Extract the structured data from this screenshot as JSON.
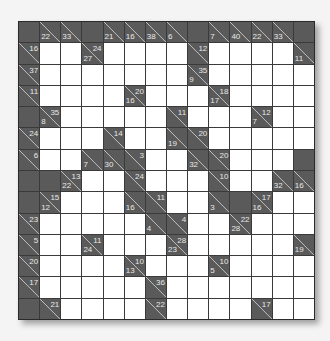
{
  "puzzle": {
    "type": "kakuro",
    "rows": 14,
    "cols": 14,
    "colors": {
      "block": "#5a5a5a",
      "white": "#ffffff",
      "grid_line": "#3a3a3a",
      "clue_text": "#e8e8e8"
    },
    "grid": [
      [
        "X",
        {
          "d": 22
        },
        {
          "d": 33
        },
        "X",
        {
          "d": 21
        },
        {
          "d": 16
        },
        {
          "d": 38
        },
        {
          "d": 6
        },
        "X",
        {
          "d": 7
        },
        {
          "d": 40
        },
        {
          "d": 22
        },
        {
          "d": 33
        },
        "X"
      ],
      [
        {
          "r": 16
        },
        "W",
        "W",
        {
          "d": 27,
          "r": 24
        },
        "W",
        "W",
        "W",
        "W",
        {
          "r": 12
        },
        "W",
        "W",
        "W",
        "W",
        {
          "d": 11
        }
      ],
      [
        {
          "r": 37
        },
        "W",
        "W",
        "W",
        "W",
        "W",
        "W",
        "W",
        {
          "d": 9,
          "r": 35
        },
        "W",
        "W",
        "W",
        "W",
        "W"
      ],
      [
        {
          "r": 11
        },
        "W",
        "W",
        "W",
        "W",
        {
          "d": 16,
          "r": 20
        },
        "W",
        "W",
        "W",
        {
          "d": 17,
          "r": 18
        },
        "W",
        "W",
        "W",
        "W"
      ],
      [
        "X",
        {
          "d": 8,
          "r": 35
        },
        "W",
        "W",
        "W",
        "W",
        "W",
        {
          "r": 11
        },
        "W",
        "W",
        "W",
        {
          "d": 7,
          "r": 12
        },
        "W",
        "W"
      ],
      [
        {
          "r": 24
        },
        "W",
        "W",
        "W",
        {
          "r": 14
        },
        "W",
        "W",
        {
          "d": 19
        },
        {
          "r": 20
        },
        "W",
        "W",
        "W",
        "W",
        "W"
      ],
      [
        {
          "r": 6
        },
        "W",
        "W",
        {
          "d": 7
        },
        {
          "d": 30
        },
        {
          "r": 3
        },
        "W",
        "W",
        {
          "d": 32
        },
        {
          "r": 20
        },
        "W",
        "W",
        "W",
        "X"
      ],
      [
        "X",
        "X",
        {
          "d": 22,
          "r": 13
        },
        "W",
        "W",
        {
          "r": 24
        },
        "W",
        "W",
        "W",
        {
          "r": 10
        },
        "W",
        "W",
        {
          "d": 32
        },
        {
          "d": 16
        }
      ],
      [
        "X",
        {
          "d": 12,
          "r": 15
        },
        "W",
        "W",
        "W",
        {
          "d": 16
        },
        {
          "r": 11
        },
        "W",
        "W",
        {
          "d": 3
        },
        "X",
        {
          "d": 16,
          "r": 17
        },
        "W",
        "W"
      ],
      [
        {
          "r": 23
        },
        "W",
        "W",
        "W",
        "W",
        "W",
        {
          "d": 4
        },
        {
          "r": 4
        },
        "W",
        "W",
        {
          "d": 28,
          "r": 22
        },
        "W",
        "W",
        "W"
      ],
      [
        {
          "r": 5
        },
        "W",
        "W",
        {
          "d": 24,
          "r": 11
        },
        "W",
        "W",
        "W",
        {
          "d": 23,
          "r": 28
        },
        "W",
        "W",
        "W",
        "W",
        "W",
        {
          "d": 19
        }
      ],
      [
        {
          "r": 20
        },
        "W",
        "W",
        "W",
        "W",
        {
          "d": 13,
          "r": 10
        },
        "W",
        "W",
        "W",
        {
          "d": 5,
          "r": 10
        },
        "W",
        "W",
        "W",
        "W"
      ],
      [
        {
          "r": 17
        },
        "W",
        "W",
        "W",
        "W",
        "W",
        {
          "r": 36
        },
        "W",
        "W",
        "W",
        "W",
        "W",
        "W",
        "W"
      ],
      [
        "X",
        {
          "r": 21
        },
        "W",
        "W",
        "W",
        "W",
        {
          "r": 22
        },
        "W",
        "W",
        "W",
        "W",
        {
          "r": 17
        },
        "W",
        "W"
      ]
    ]
  }
}
